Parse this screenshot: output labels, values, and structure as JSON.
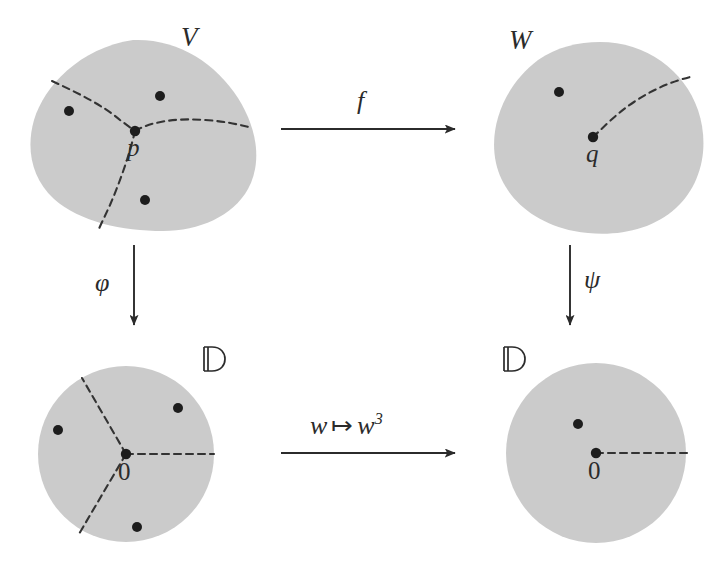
{
  "figure": {
    "type": "commutative-diagram",
    "background_color": "#ffffff",
    "region_fill_color": "#cbcbcb",
    "ink_color": "#2b2b2b"
  },
  "nodes": {
    "top_left": {
      "label": "V",
      "shape": "blob",
      "marked_point_label": "p",
      "branch_arcs": 3,
      "extra_points": 3
    },
    "top_right": {
      "label": "W",
      "shape": "blob",
      "marked_point_label": "q",
      "branch_arcs": 1,
      "extra_points": 1
    },
    "bottom_left": {
      "label": "ᴰ",
      "label_display": "D",
      "shape": "disk",
      "marked_point_label": "0",
      "branch_arcs": 3,
      "extra_points": 3
    },
    "bottom_right": {
      "label": "D",
      "shape": "disk",
      "marked_point_label": "0",
      "branch_arcs": 1,
      "extra_points": 1
    }
  },
  "arrows": {
    "top": {
      "label": "f",
      "direction": "right",
      "from": "V",
      "to": "W"
    },
    "bottom": {
      "label_parts": {
        "variable": "w",
        "mapsto": "↦",
        "image_base": "w",
        "image_exponent": "3"
      },
      "label_plain": "w ↦ w³",
      "direction": "right",
      "from": "D",
      "to": "D"
    },
    "left": {
      "label": "φ",
      "direction": "down",
      "from": "V",
      "to": "D"
    },
    "right": {
      "label": "ψ",
      "direction": "down",
      "from": "W",
      "to": "D"
    }
  }
}
